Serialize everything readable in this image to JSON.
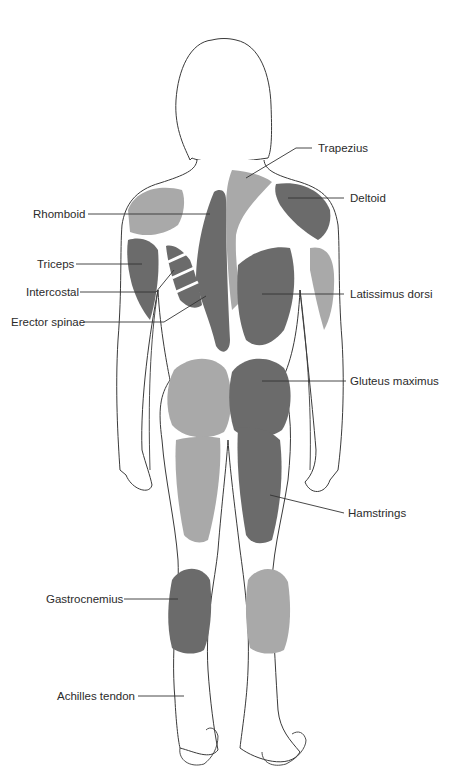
{
  "diagram": {
    "colors": {
      "background": "#ffffff",
      "outline": "#3a3a3a",
      "muscle_dark": "#6b6b6b",
      "muscle_light": "#a9a9a9",
      "fiber_line": "#d6d6d6",
      "label_text": "#2b2b2b",
      "leader_line": "#333333"
    },
    "labels": {
      "trapezius": "Trapezius",
      "deltoid": "Deltoid",
      "rhomboid": "Rhomboid",
      "triceps": "Triceps",
      "intercostal": "Intercostal",
      "erector_spinae": "Erector spinae",
      "latissimus_dorsi": "Latissimus dorsi",
      "gluteus_maximus": "Gluteus maximus",
      "hamstrings": "Hamstrings",
      "gastrocnemius": "Gastrocnemius",
      "achilles_tendon": "Achilles tendon"
    }
  }
}
